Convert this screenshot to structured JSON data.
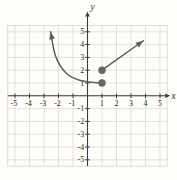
{
  "figure": {
    "colors": {
      "background": "#fefdf9",
      "grid": "#d8d6ca",
      "axis": "#3c3c3c",
      "tick_text": "#2f2f2f",
      "curve": "#5d5d5d",
      "dot": "#656565"
    }
  },
  "chart_data": {
    "type": "line",
    "title": "",
    "xlabel": "x",
    "ylabel": "y",
    "xlim": [
      -5.5,
      5.5
    ],
    "ylim": [
      -5.5,
      5.5
    ],
    "grid": true,
    "x_ticks": [
      -5,
      -4,
      -3,
      -2,
      -1,
      1,
      2,
      3,
      4,
      5
    ],
    "y_ticks": [
      -5,
      -4,
      -3,
      -2,
      -1,
      1,
      2,
      3,
      4,
      5
    ],
    "series": [
      {
        "name": "left-branch-curve",
        "shape": "smooth",
        "arrow": "start",
        "points": [
          [
            -2.55,
            5.0
          ],
          [
            -2.2,
            3.1
          ],
          [
            -1.5,
            1.8
          ],
          [
            -0.5,
            1.2
          ],
          [
            1,
            1
          ]
        ]
      },
      {
        "name": "right-ray",
        "shape": "line",
        "arrow": "end",
        "points": [
          [
            1,
            2
          ],
          [
            3.85,
            4.3
          ]
        ]
      }
    ],
    "points": [
      {
        "x": 1,
        "y": 1,
        "style": "closed"
      },
      {
        "x": 1,
        "y": 2,
        "style": "closed"
      }
    ]
  }
}
